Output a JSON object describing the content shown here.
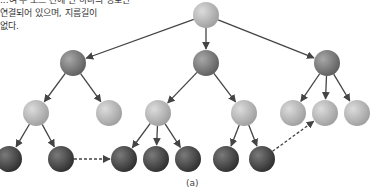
{
  "caption": {
    "lines": [
      "...여 두 노드 간에 단 하나의 경로만",
      "연결되어 있으며, 지름길이",
      "없다."
    ]
  },
  "figure_label": "(a)",
  "colors": {
    "dark": "#5a5a5a",
    "mid": "#8a8a8a",
    "light": "#bdbdbd",
    "edge": "#444444"
  },
  "nodes": [
    {
      "id": "root",
      "x": 206,
      "y": 15,
      "shade": "light"
    },
    {
      "id": "a",
      "x": 73,
      "y": 63,
      "shade": "mid"
    },
    {
      "id": "b",
      "x": 206,
      "y": 63,
      "shade": "mid"
    },
    {
      "id": "c",
      "x": 327,
      "y": 63,
      "shade": "mid"
    },
    {
      "id": "a1",
      "x": 36,
      "y": 113,
      "shade": "light"
    },
    {
      "id": "a2",
      "x": 109,
      "y": 113,
      "shade": "light"
    },
    {
      "id": "b1",
      "x": 158,
      "y": 113,
      "shade": "light"
    },
    {
      "id": "b2",
      "x": 244,
      "y": 113,
      "shade": "light"
    },
    {
      "id": "c1",
      "x": 293,
      "y": 113,
      "shade": "light"
    },
    {
      "id": "c2",
      "x": 325,
      "y": 113,
      "shade": "light"
    },
    {
      "id": "c3",
      "x": 357,
      "y": 113,
      "shade": "light"
    },
    {
      "id": "a11",
      "x": 9,
      "y": 159,
      "shade": "dark"
    },
    {
      "id": "a12",
      "x": 61,
      "y": 159,
      "shade": "dark"
    },
    {
      "id": "b11",
      "x": 124,
      "y": 159,
      "shade": "dark"
    },
    {
      "id": "b12",
      "x": 156,
      "y": 159,
      "shade": "dark"
    },
    {
      "id": "b13",
      "x": 188,
      "y": 159,
      "shade": "dark"
    },
    {
      "id": "b21",
      "x": 226,
      "y": 159,
      "shade": "dark"
    },
    {
      "id": "b22",
      "x": 262,
      "y": 159,
      "shade": "dark"
    }
  ],
  "edges": [
    [
      "root",
      "a"
    ],
    [
      "root",
      "b"
    ],
    [
      "root",
      "c"
    ],
    [
      "a",
      "a1"
    ],
    [
      "a",
      "a2"
    ],
    [
      "b",
      "b1"
    ],
    [
      "b",
      "b2"
    ],
    [
      "c",
      "c1"
    ],
    [
      "c",
      "c2"
    ],
    [
      "c",
      "c3"
    ],
    [
      "a1",
      "a11"
    ],
    [
      "a1",
      "a12"
    ],
    [
      "b1",
      "b11"
    ],
    [
      "b1",
      "b12"
    ],
    [
      "b1",
      "b13"
    ],
    [
      "b2",
      "b21"
    ],
    [
      "b2",
      "b22"
    ]
  ],
  "dashed_edges": [
    [
      "a12",
      "b11"
    ],
    [
      "b22",
      "c2"
    ]
  ]
}
